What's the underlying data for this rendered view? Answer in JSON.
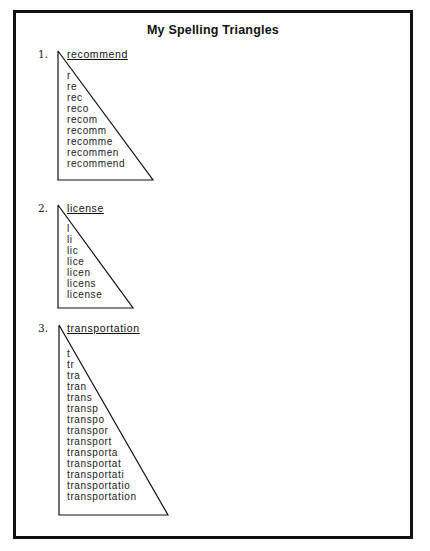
{
  "document": {
    "title": "My Spelling Triangles",
    "triangles": [
      {
        "number": "1.",
        "word": "recommend",
        "rows": [
          "r",
          "re",
          "rec",
          "reco",
          "recom",
          "recomm",
          "recomme",
          "recommen",
          "recommend"
        ]
      },
      {
        "number": "2.",
        "word": "license",
        "rows": [
          "l",
          "li",
          "lic",
          "lice",
          "licen",
          "licens",
          "license"
        ]
      },
      {
        "number": "3.",
        "word": "transportation",
        "rows": [
          "t",
          "tr",
          "tra",
          "tran",
          "trans",
          "transp",
          "transpo",
          "transpor",
          "transport",
          "transporta",
          "transportat",
          "transportati",
          "transportatio",
          "transportation"
        ]
      }
    ]
  },
  "colors": {
    "border": "#111111",
    "text": "#1a1a1a",
    "background": "#ffffff"
  }
}
